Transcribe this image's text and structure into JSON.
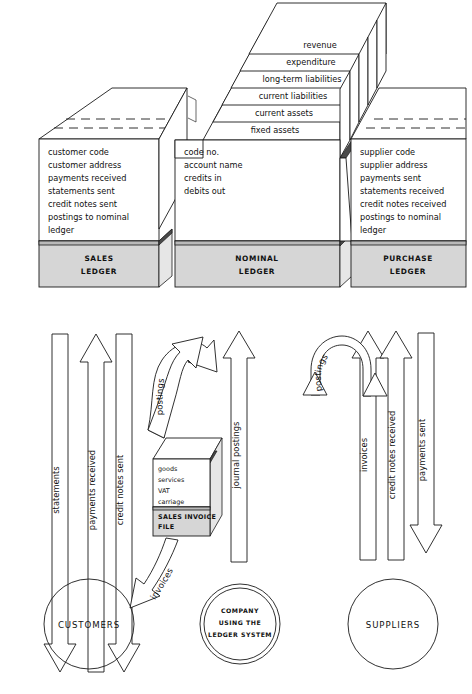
{
  "figure": {
    "colors": {
      "ink": "#1a1a1a",
      "base_gray": "#d6d6d6",
      "shadow_gray": "#b9b9b9",
      "paper": "#ffffff"
    }
  },
  "ledgers": [
    {
      "id": "sales",
      "name_line1": "SALES",
      "name_line2": "LEDGER",
      "fields": [
        "customer code",
        "customer address",
        "payments received",
        "statements sent",
        "credit notes sent",
        "postings to nominal",
        "ledger"
      ]
    },
    {
      "id": "nominal",
      "name_line1": "NOMINAL",
      "name_line2": "LEDGER",
      "fields": [
        "code no.",
        "account name",
        "credits in",
        "debits out"
      ],
      "top_layers": [
        "revenue",
        "expenditure",
        "long-term liabilities",
        "current liabilities",
        "current assets",
        "fixed assets"
      ]
    },
    {
      "id": "purchase",
      "name_line1": "PURCHASE",
      "name_line2": "LEDGER",
      "fields": [
        "supplier code",
        "supplier address",
        "payments sent",
        "statements received",
        "credit notes received",
        "postings to nominal",
        "ledger"
      ]
    }
  ],
  "flows": {
    "left": [
      {
        "label": "statements",
        "direction": "down"
      },
      {
        "label": "payments received",
        "direction": "up"
      },
      {
        "label": "credit notes sent",
        "direction": "down"
      }
    ],
    "centre": [
      {
        "label": "journal postings",
        "direction": "up"
      }
    ],
    "right": [
      {
        "label": "invoices",
        "direction": "up"
      },
      {
        "label": "credit notes received",
        "direction": "up"
      },
      {
        "label": "payments sent",
        "direction": "down"
      }
    ],
    "curved": [
      {
        "label": "postings",
        "id": "postings-left",
        "direction": "u-turn"
      },
      {
        "label": "postings",
        "id": "postings-right",
        "direction": "u-turn"
      },
      {
        "label": "invoices",
        "id": "invoices-curve",
        "direction": "down-left"
      }
    ]
  },
  "invoice_file": {
    "items": [
      "goods",
      "services",
      "VAT",
      "carriage"
    ],
    "label_line1": "SALES INVOICE",
    "label_line2": "FILE"
  },
  "entities": [
    {
      "id": "customers",
      "lines": [
        "CUSTOMERS"
      ]
    },
    {
      "id": "company",
      "lines": [
        "COMPANY",
        "USING THE",
        "LEDGER SYSTEM"
      ]
    },
    {
      "id": "suppliers",
      "lines": [
        "SUPPLIERS"
      ]
    }
  ]
}
